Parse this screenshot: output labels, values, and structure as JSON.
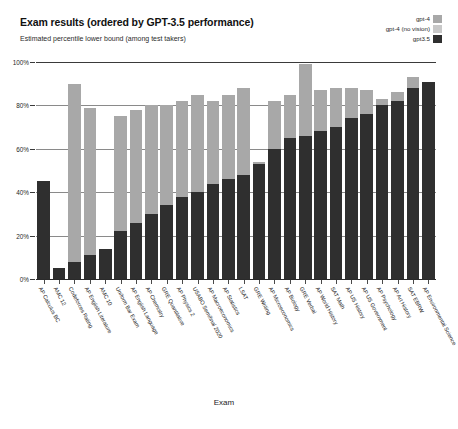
{
  "header": {
    "title": "Exam results (ordered by GPT-3.5 performance)",
    "subtitle": "Estimated percentile lower bound (among test takers)"
  },
  "legend": {
    "position": "top-right",
    "entries": [
      {
        "label": "gpt-4",
        "color": "#a8a8a8"
      },
      {
        "label": "gpt-4 (no vision)",
        "color": "#c8c8c8"
      },
      {
        "label": "gpt3.5",
        "color": "#2f2f2f"
      }
    ]
  },
  "axes": {
    "x_title": "Exam",
    "y_ticks": [
      "0%",
      "20%",
      "40%",
      "60%",
      "80%",
      "100%"
    ]
  },
  "chart_data": {
    "type": "bar",
    "title": "Exam results (ordered by GPT-3.5 performance)",
    "subtitle": "Estimated percentile lower bound (among test takers)",
    "xlabel": "Exam",
    "ylabel": "Estimated percentile lower bound (among test takers)",
    "ylim": [
      0,
      100
    ],
    "ytick_values": [
      0,
      20,
      40,
      60,
      80,
      100
    ],
    "ytick_labels": [
      "0%",
      "20%",
      "40%",
      "60%",
      "80%",
      "100%"
    ],
    "grid": true,
    "legend_position": "top-right",
    "categories": [
      "AP Calculus BC",
      "AMC 12",
      "Codeforces Rating",
      "AP English Literature",
      "AMC 10",
      "Uniform Bar Exam",
      "AP English Language",
      "AP Chemistry",
      "GRE Quantitative",
      "AP Physics 2",
      "USABO Semifinal 2020",
      "AP Macroeconomics",
      "AP Statistics",
      "LSAT",
      "GRE Writing",
      "AP Microeconomics",
      "AP Biology",
      "GRE Verbal",
      "AP World History",
      "SAT Math",
      "AP US History",
      "AP US Government",
      "AP Psychology",
      "AP Art History",
      "SAT EBRW",
      "AP Environmental Science"
    ],
    "series": [
      {
        "name": "gpt-4",
        "color": "#a8a8a8",
        "values": [
          43,
          0,
          90,
          79,
          0,
          75,
          78,
          80,
          80,
          82,
          85,
          82,
          85,
          88,
          54,
          82,
          85,
          99,
          87,
          88,
          88,
          87,
          83,
          86,
          93,
          91
        ]
      },
      {
        "name": "gpt-4 (no vision)",
        "color": "#c8c8c8",
        "values": [
          0,
          0,
          0,
          0,
          0,
          0,
          0,
          0,
          0,
          0,
          0,
          0,
          0,
          0,
          0,
          0,
          0,
          0,
          0,
          0,
          0,
          0,
          0,
          0,
          0,
          0
        ]
      },
      {
        "name": "gpt3.5",
        "color": "#2f2f2f",
        "values": [
          45,
          5,
          8,
          11,
          14,
          22,
          26,
          30,
          34,
          38,
          40,
          44,
          46,
          48,
          53,
          60,
          65,
          66,
          68,
          70,
          74,
          76,
          80,
          82,
          88,
          91
        ]
      }
    ]
  }
}
